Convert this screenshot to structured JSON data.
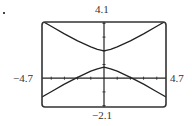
{
  "chart_data": {
    "type": "line",
    "title": "",
    "xlabel": "",
    "ylabel": "",
    "window": {
      "xmin": -4.7,
      "xmax": 4.7,
      "ymin": -2.1,
      "ymax": 4.1
    },
    "xlim": [
      -4.7,
      4.7
    ],
    "ylim": [
      -2.1,
      4.1
    ],
    "tick_labels": {
      "top": "4.1",
      "bottom": "-2.1",
      "left": "-4.7",
      "right": "4.7"
    },
    "x_ticks": [
      -4,
      -3,
      -2,
      -1,
      1,
      2,
      3,
      4
    ],
    "y_ticks": [
      -2,
      -1,
      1,
      2,
      3,
      4
    ],
    "grid": false,
    "legend": null,
    "series": [
      {
        "name": "upper branch",
        "x": [
          -4.7,
          -4,
          -3,
          -2,
          -1,
          -0.5,
          0,
          0.5,
          1,
          2,
          3,
          4,
          4.7
        ],
        "y": [
          4.17,
          3.79,
          3.23,
          2.73,
          2.29,
          2.11,
          2.0,
          2.11,
          2.29,
          2.73,
          3.23,
          3.79,
          4.17
        ]
      },
      {
        "name": "lower branch",
        "x": [
          -4.7,
          -4,
          -3,
          -2,
          -1,
          -0.5,
          0,
          0.5,
          1,
          2,
          3,
          4,
          4.7
        ],
        "y": [
          -1.37,
          -0.99,
          -0.43,
          0.07,
          0.51,
          0.69,
          0.8,
          0.69,
          0.51,
          0.07,
          -0.43,
          -0.99,
          -1.37
        ]
      }
    ]
  },
  "labels": {
    "ymax": "4.1",
    "ymin": "−2.1",
    "xmin": "−4.7",
    "xmax": "4.7"
  }
}
